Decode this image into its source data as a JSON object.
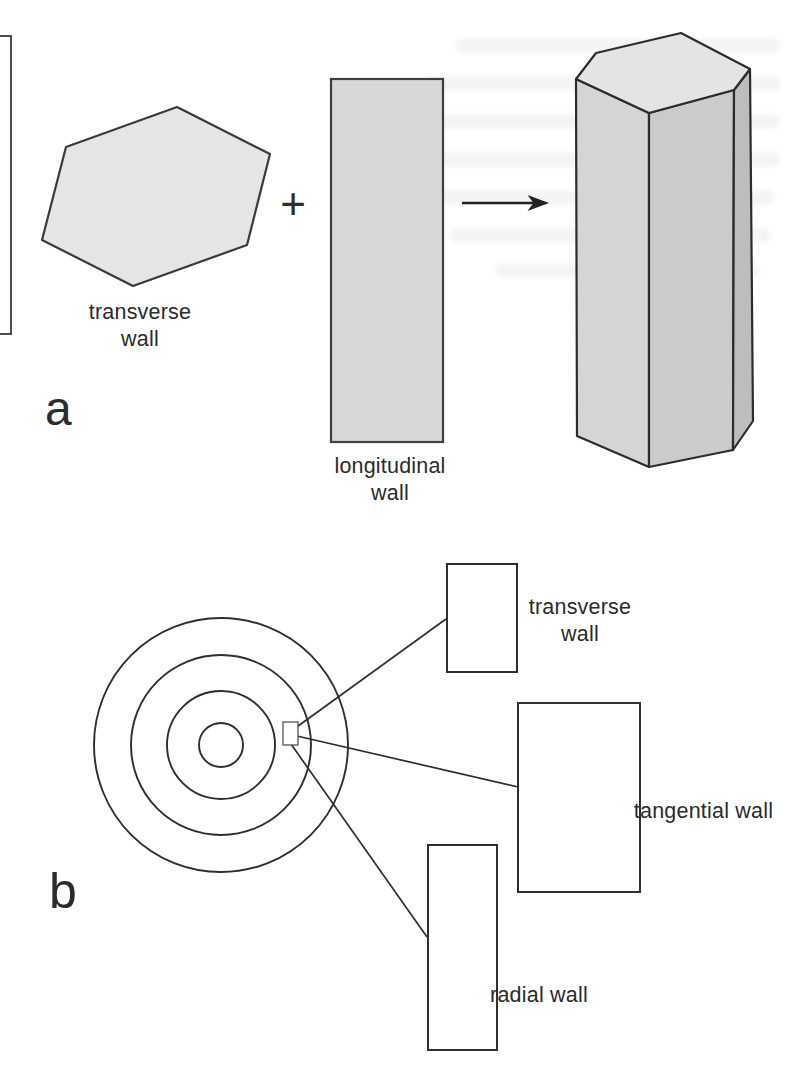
{
  "figure": {
    "panel_a": {
      "panel_label": "a",
      "plus_sign": "+",
      "hexagon_label": "transverse wall",
      "rectangle_label": "longitudinal wall"
    },
    "panel_b": {
      "panel_label": "b",
      "transverse_label": "transverse wall",
      "tangential_label": "tangential wall",
      "radial_label": "radial wall"
    },
    "colors": {
      "outline": "#333333",
      "hexagon_fill": "#e5e5e5",
      "longitudinal_fill": "#d8d8d8",
      "prism_top_fill": "#e4e4e4",
      "prism_left_fill": "#d5d5d5",
      "prism_right_fill": "#cbcbcb",
      "prism_side_fill": "#bdbdbd"
    }
  }
}
